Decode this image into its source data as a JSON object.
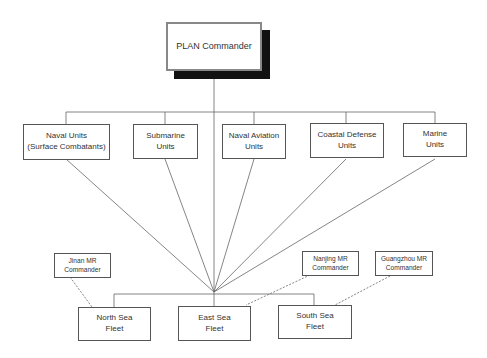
{
  "diagram": {
    "root": {
      "label": "PLAN Commander"
    },
    "units": [
      {
        "label": "Naval Units\n(Surface Combatants)"
      },
      {
        "label": "Submarine\nUnits"
      },
      {
        "label": "Naval Aviation\nUnits"
      },
      {
        "label": "Coastal Defense\nUnits"
      },
      {
        "label": "Marine\nUnits"
      }
    ],
    "fleets": [
      {
        "label": "North Sea\nFleet"
      },
      {
        "label": "East Sea\nFleet"
      },
      {
        "label": "South Sea\nFleet"
      }
    ],
    "mr_commanders": [
      {
        "label": "Jinan MR\nCommander",
        "linked_fleet": "North Sea Fleet"
      },
      {
        "label": "Nanjing MR\nCommander",
        "linked_fleet": "East Sea Fleet"
      },
      {
        "label": "Guangzhou MR\nCommander",
        "linked_fleet": "South Sea Fleet"
      }
    ],
    "colors": {
      "line": "#555555",
      "shadow": "#111111",
      "root_border": "#888888"
    }
  }
}
